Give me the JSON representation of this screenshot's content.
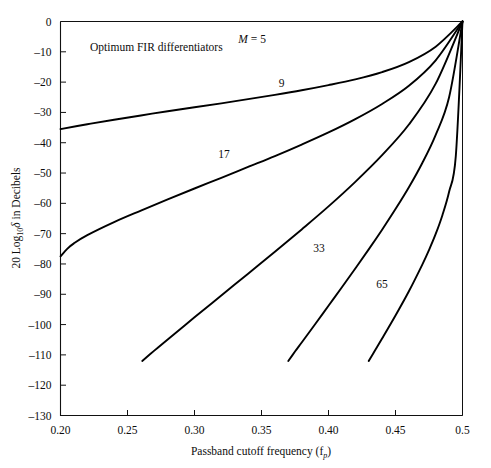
{
  "chart_data": {
    "type": "line",
    "title": "",
    "annotation": "Optimum FIR differentiators",
    "xlabel": "Passband cutoff frequency (f",
    "xlabel_sub": "p",
    "xlabel_tail": ")",
    "ylabel_prefix": "20 Log",
    "ylabel_sub": "10",
    "ylabel_mid": "δ",
    "ylabel_tail": " in Decibels",
    "xlim": [
      0.2,
      0.5
    ],
    "ylim": [
      -130,
      0
    ],
    "xticks": [
      0.2,
      0.25,
      0.3,
      0.35,
      0.4,
      0.45,
      0.5
    ],
    "xtick_labels": [
      "0.20",
      "0.25",
      "0.30",
      "0.35",
      "0.40",
      "0.45",
      "0.5"
    ],
    "yticks": [
      0,
      -10,
      -20,
      -30,
      -40,
      -50,
      -60,
      -70,
      -80,
      -90,
      -100,
      -110,
      -120,
      -130
    ],
    "ytick_labels": [
      "0",
      "–10",
      "–20",
      "–30",
      "–40",
      "–50",
      "–60",
      "–70",
      "–80",
      "–90",
      "–100",
      "–110",
      "–120",
      "–130"
    ],
    "grid": false,
    "legend_position": "inline-curve-labels",
    "axis_color": "#111111",
    "curve_color": "#000000",
    "series": [
      {
        "name": "M = 5",
        "label": "M = 5",
        "label_italic_prefix": "M",
        "label_rest": " = 5",
        "label_x": 0.343,
        "label_y": -7.0,
        "x": [
          0.2,
          0.22,
          0.24,
          0.26,
          0.28,
          0.3,
          0.32,
          0.34,
          0.36,
          0.38,
          0.4,
          0.42,
          0.44,
          0.46,
          0.48,
          0.5
        ],
        "y": [
          -35.5,
          -33.9,
          -32.4,
          -31.0,
          -29.6,
          -28.3,
          -27.0,
          -25.6,
          -24.2,
          -22.7,
          -21.0,
          -19.1,
          -16.7,
          -13.4,
          -8.3,
          0.0
        ]
      },
      {
        "name": "9",
        "label": "9",
        "label_x": 0.365,
        "label_y": -21.5,
        "x": [
          0.2,
          0.205,
          0.21,
          0.22,
          0.24,
          0.26,
          0.28,
          0.3,
          0.32,
          0.34,
          0.36,
          0.38,
          0.4,
          0.42,
          0.44,
          0.46,
          0.48,
          0.5
        ],
        "y": [
          -77.5,
          -75.0,
          -73.2,
          -70.5,
          -66.2,
          -62.4,
          -58.7,
          -55.1,
          -51.6,
          -48.0,
          -44.4,
          -40.6,
          -36.6,
          -32.2,
          -27.2,
          -21.2,
          -12.8,
          0.0
        ]
      },
      {
        "name": "17",
        "label": "17",
        "label_x": 0.322,
        "label_y": -45.0,
        "x": [
          0.261,
          0.27,
          0.28,
          0.3,
          0.32,
          0.34,
          0.36,
          0.38,
          0.4,
          0.42,
          0.44,
          0.46,
          0.48,
          0.5
        ],
        "y": [
          -112.0,
          -108.6,
          -104.9,
          -97.6,
          -90.4,
          -83.2,
          -76.0,
          -68.6,
          -61.0,
          -52.9,
          -44.1,
          -34.0,
          -20.5,
          0.0
        ]
      },
      {
        "name": "33",
        "label": "33",
        "label_x": 0.393,
        "label_y": -76.0,
        "x": [
          0.37,
          0.375,
          0.38,
          0.39,
          0.4,
          0.41,
          0.42,
          0.43,
          0.44,
          0.45,
          0.46,
          0.47,
          0.48,
          0.49,
          0.5
        ],
        "y": [
          -112.0,
          -108.9,
          -105.9,
          -99.9,
          -93.8,
          -87.7,
          -81.5,
          -75.2,
          -68.7,
          -61.9,
          -54.7,
          -46.7,
          -37.4,
          -25.0,
          0.0
        ]
      },
      {
        "name": "65",
        "label": "65",
        "label_x": 0.44,
        "label_y": -88.0,
        "x": [
          0.43,
          0.435,
          0.44,
          0.45,
          0.46,
          0.47,
          0.475,
          0.48,
          0.485,
          0.49,
          0.495,
          0.5
        ],
        "y": [
          -112.0,
          -108.3,
          -104.6,
          -97.0,
          -89.0,
          -80.2,
          -75.4,
          -70.1,
          -63.9,
          -56.2,
          -44.4,
          0.0
        ]
      }
    ]
  }
}
